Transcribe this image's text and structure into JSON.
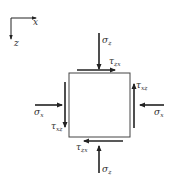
{
  "diagram": {
    "type": "stress-element",
    "colors": {
      "line": "#222222",
      "text": "#333333",
      "background": "#ffffff"
    },
    "axes": {
      "x_label": "x",
      "z_label": "z"
    },
    "labels": {
      "sigma_z_top": {
        "symbol": "σ",
        "sub": "z"
      },
      "sigma_z_bottom": {
        "symbol": "σ",
        "sub": "z"
      },
      "sigma_x_left": {
        "symbol": "σ",
        "sub": "x"
      },
      "sigma_x_right": {
        "symbol": "σ",
        "sub": "x"
      },
      "tau_zx_top": {
        "symbol": "τ",
        "sub": "zx"
      },
      "tau_zx_bottom": {
        "symbol": "τ",
        "sub": "zx"
      },
      "tau_xz_left": {
        "symbol": "τ",
        "sub": "xz"
      },
      "tau_xz_right": {
        "symbol": "τ",
        "sub": "xz"
      }
    }
  }
}
